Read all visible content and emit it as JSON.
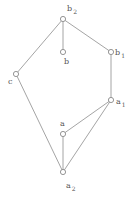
{
  "diagram": {
    "type": "hasse-diagram",
    "nodes": [
      {
        "id": "b2",
        "base": "b",
        "sub": "2",
        "x": 63,
        "y": 19,
        "lx": 67,
        "ly": 11
      },
      {
        "id": "b",
        "base": "b",
        "sub": "",
        "x": 63,
        "y": 52,
        "lx": 64,
        "ly": 64
      },
      {
        "id": "b1",
        "base": "b",
        "sub": "1",
        "x": 111,
        "y": 52,
        "lx": 115,
        "ly": 55
      },
      {
        "id": "c",
        "base": "c",
        "sub": "",
        "x": 16,
        "y": 74,
        "lx": 8,
        "ly": 84
      },
      {
        "id": "a1",
        "base": "a",
        "sub": "1",
        "x": 111,
        "y": 100,
        "lx": 116,
        "ly": 104
      },
      {
        "id": "a",
        "base": "a",
        "sub": "",
        "x": 63,
        "y": 134,
        "lx": 60,
        "ly": 126
      },
      {
        "id": "a2",
        "base": "a",
        "sub": "2",
        "x": 63,
        "y": 172,
        "lx": 66,
        "ly": 188
      }
    ],
    "edges": [
      [
        "b2",
        "b"
      ],
      [
        "b2",
        "b1"
      ],
      [
        "b2",
        "c"
      ],
      [
        "b1",
        "a1"
      ],
      [
        "c",
        "a2"
      ],
      [
        "a1",
        "a"
      ],
      [
        "a1",
        "a2"
      ],
      [
        "a",
        "a2"
      ]
    ],
    "colors": {
      "edge": "#9a9a9a",
      "node": "#8a8a8a",
      "label": "#555555"
    }
  }
}
